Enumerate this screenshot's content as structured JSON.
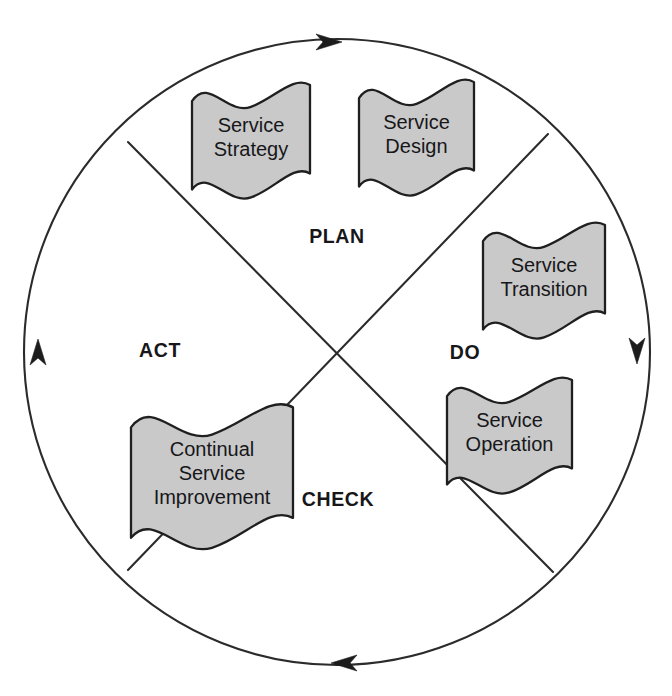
{
  "diagram": {
    "type": "cycle-diagram",
    "colors": {
      "flag_fill": "#c9c9c9",
      "flag_stroke": "#1f1f1f",
      "circle_stroke": "#2b2b2b",
      "text": "#17171a",
      "background": "#ffffff"
    },
    "wheel": {
      "center_x": 337,
      "center_y": 352,
      "radius": 313
    },
    "phases": [
      {
        "id": "plan",
        "label": "PLAN",
        "x": 337,
        "y": 238
      },
      {
        "id": "do",
        "label": "DO",
        "x": 465,
        "y": 354
      },
      {
        "id": "check",
        "label": "CHECK",
        "x": 338,
        "y": 501
      },
      {
        "id": "act",
        "label": "ACT",
        "x": 160,
        "y": 352
      }
    ],
    "flags": [
      {
        "id": "service-strategy",
        "lines": [
          "Service",
          "Strategy"
        ],
        "x": 192,
        "y": 88,
        "width": 118,
        "height": 100,
        "phase": "plan"
      },
      {
        "id": "service-design",
        "lines": [
          "Service",
          "Design"
        ],
        "x": 359,
        "y": 85,
        "width": 115,
        "height": 100,
        "phase": "plan"
      },
      {
        "id": "service-transition",
        "lines": [
          "Service",
          "Transition"
        ],
        "x": 483,
        "y": 228,
        "width": 122,
        "height": 100,
        "phase": "do"
      },
      {
        "id": "service-operation",
        "lines": [
          "Service",
          "Operation"
        ],
        "x": 447,
        "y": 383,
        "width": 125,
        "height": 100,
        "phase": "do"
      },
      {
        "id": "continual-service-improvement",
        "lines": [
          "Continual",
          "Service",
          "Improvement"
        ],
        "x": 131,
        "y": 411,
        "width": 162,
        "height": 125,
        "phase": "act"
      }
    ],
    "arrows": [
      {
        "id": "arrow-top",
        "direction": "clockwise-right",
        "angle_deg": 269
      },
      {
        "id": "arrow-right",
        "direction": "clockwise-down",
        "angle_deg": 359
      },
      {
        "id": "arrow-bottom",
        "direction": "clockwise-left",
        "angle_deg": 93
      },
      {
        "id": "arrow-left",
        "direction": "clockwise-up",
        "angle_deg": 180
      }
    ],
    "dividers": [
      {
        "id": "divider-nw-se",
        "x1": 128,
        "y1": 142,
        "x2": 553,
        "y2": 572
      },
      {
        "id": "divider-ne-sw",
        "x1": 548,
        "y1": 134,
        "x2": 128,
        "y2": 570
      }
    ]
  }
}
